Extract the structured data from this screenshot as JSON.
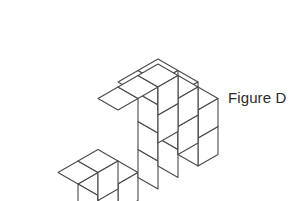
{
  "figure": {
    "label": "Figure D",
    "label_x": 228,
    "label_y": 90,
    "stroke_color": "#4a4a4a",
    "stroke_width": 1.1,
    "face_top_color": "#ffffff",
    "face_left_color": "#ffffff",
    "face_right_color": "#ffffff",
    "background_color": "#ffffff",
    "text_color": "#2b2b2b"
  },
  "geometry": {
    "unit_half_width": 20,
    "unit_half_depth": 11.5,
    "unit_height": 28,
    "origin_x": 158,
    "origin_y": 189,
    "description": "isometric-cube-stack"
  },
  "blocks": [
    {
      "name": "main-block",
      "cols": 3,
      "rows": 3,
      "levels": 2,
      "offset_x": 0,
      "offset_y": 0,
      "offset_z": 0
    },
    {
      "name": "top-block",
      "cols": 2,
      "rows": 2,
      "levels": 1,
      "offset_x": 0,
      "offset_y": 0,
      "offset_z": 2
    },
    {
      "name": "left-block",
      "cols": 2,
      "rows": 2,
      "levels": 1,
      "offset_x": -3,
      "offset_y": 0,
      "offset_z": 0
    }
  ],
  "cube_count": {
    "main": 18,
    "top": 4,
    "left": 4,
    "total": 26
  }
}
